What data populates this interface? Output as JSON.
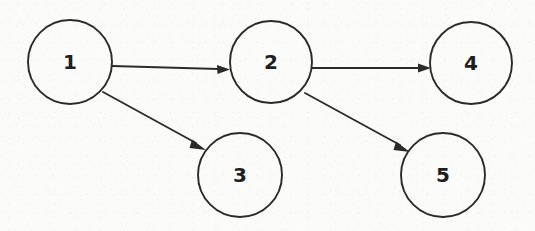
{
  "diagram": {
    "background_color": "#fbfbf9",
    "ink_color": "#2b2b2b",
    "nodes": [
      {
        "id": "1",
        "label": "1",
        "cx": 70,
        "cy": 62,
        "r": 42
      },
      {
        "id": "2",
        "label": "2",
        "cx": 271,
        "cy": 62,
        "r": 41
      },
      {
        "id": "3",
        "label": "3",
        "cx": 240,
        "cy": 175,
        "r": 42
      },
      {
        "id": "4",
        "label": "4",
        "cx": 471,
        "cy": 63,
        "r": 41
      },
      {
        "id": "5",
        "label": "5",
        "cx": 443,
        "cy": 175,
        "r": 42
      }
    ],
    "edges": [
      {
        "id": "edge-1-2",
        "from": "1",
        "to": "2",
        "directed": true
      },
      {
        "id": "edge-1-3",
        "from": "1",
        "to": "3",
        "directed": true
      },
      {
        "id": "edge-2-4",
        "from": "2",
        "to": "4",
        "directed": true
      },
      {
        "id": "edge-2-5",
        "from": "2",
        "to": "5",
        "directed": true
      }
    ]
  }
}
